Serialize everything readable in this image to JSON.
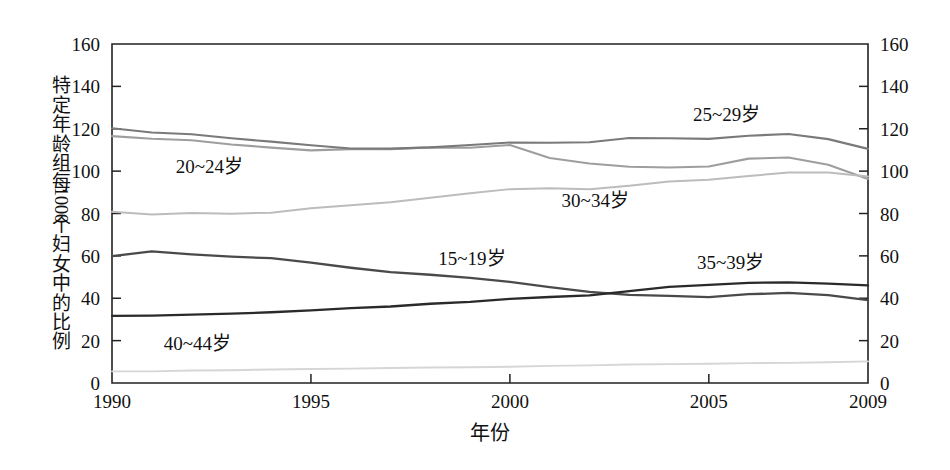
{
  "chart_data": {
    "type": "line",
    "title": "",
    "xlabel": "年份",
    "ylabel": "特定年龄组每1000个妇女中的比例",
    "ylabel_parts": [
      "特",
      "定",
      "年",
      "龄",
      "组",
      "每",
      "1000",
      "个",
      "妇",
      "女",
      "中",
      "的",
      "比",
      "例"
    ],
    "xlim": [
      1990,
      2009
    ],
    "ylim": [
      0,
      160
    ],
    "grid": false,
    "legend_position": "inline-annotations",
    "x_ticks": [
      1990,
      1995,
      2000,
      2005,
      2009
    ],
    "x_tick_labels": [
      "1990",
      "1995",
      "2000",
      "2005",
      "2009"
    ],
    "y_ticks": [
      0,
      20,
      40,
      60,
      80,
      100,
      120,
      140,
      160
    ],
    "y_tick_labels_left": [
      "0",
      "20",
      "40",
      "60",
      "80",
      "100",
      "120",
      "140",
      "160"
    ],
    "y_tick_labels_right": [
      "0",
      "20",
      "40",
      "60",
      "80",
      "100",
      "120",
      "140",
      "160"
    ],
    "x": [
      1990,
      1991,
      1992,
      1993,
      1994,
      1995,
      1996,
      1997,
      1998,
      1999,
      2000,
      2001,
      2002,
      2003,
      2004,
      2005,
      2006,
      2007,
      2008,
      2009
    ],
    "series": [
      {
        "name": "15~19岁",
        "label": "15~19岁",
        "color": "#4a4a4a",
        "width": 2.3,
        "label_x": 1998.2,
        "label_y": 55.5,
        "values": [
          59.9,
          62.1,
          60.7,
          59.6,
          58.9,
          56.8,
          54.4,
          52.3,
          51.1,
          49.6,
          47.7,
          45.3,
          43.0,
          41.6,
          41.1,
          40.5,
          41.9,
          42.5,
          41.5,
          39.1
        ]
      },
      {
        "name": "20~24岁",
        "label": "20~24岁",
        "color": "#9e9e9e",
        "width": 2.1,
        "label_x": 1991.6,
        "label_y": 99.0,
        "values": [
          116.5,
          115.3,
          114.6,
          112.6,
          111.1,
          109.8,
          110.4,
          110.4,
          111.2,
          111.0,
          112.3,
          106.2,
          103.6,
          102.1,
          101.7,
          102.2,
          105.9,
          106.4,
          103.0,
          96.3
        ]
      },
      {
        "name": "25~29岁",
        "label": "25~29岁",
        "color": "#7a7a7a",
        "width": 2.1,
        "label_x": 2004.6,
        "label_y": 123.5,
        "values": [
          120.2,
          118.2,
          117.4,
          115.5,
          113.9,
          112.2,
          110.7,
          110.6,
          111.2,
          112.3,
          113.5,
          113.4,
          113.6,
          115.6,
          115.5,
          115.2,
          116.7,
          117.5,
          115.1,
          110.5
        ]
      },
      {
        "name": "30~34岁",
        "label": "30~34岁",
        "color": "#bcbcbc",
        "width": 2.0,
        "label_x": 2001.3,
        "label_y": 83.2,
        "values": [
          80.8,
          79.5,
          80.2,
          79.9,
          80.4,
          82.5,
          83.9,
          85.3,
          87.4,
          89.6,
          91.5,
          91.9,
          91.5,
          93.1,
          95.1,
          95.9,
          97.7,
          99.3,
          99.3,
          97.5
        ]
      },
      {
        "name": "35~39岁",
        "label": "35~39岁",
        "color": "#2a2a2a",
        "width": 2.3,
        "label_x": 2004.7,
        "label_y": 54.0,
        "values": [
          31.7,
          31.8,
          32.3,
          32.7,
          33.4,
          34.3,
          35.3,
          36.1,
          37.4,
          38.3,
          39.7,
          40.6,
          41.4,
          43.4,
          45.4,
          46.3,
          47.3,
          47.5,
          46.9,
          46.1
        ]
      },
      {
        "name": "40~44岁",
        "label": "40~44岁",
        "color": "#d6d6d6",
        "width": 1.9,
        "label_x": 1991.3,
        "label_y": 15.5,
        "values": [
          5.5,
          5.5,
          5.9,
          6.0,
          6.4,
          6.6,
          6.8,
          7.1,
          7.3,
          7.4,
          7.7,
          8.1,
          8.3,
          8.7,
          8.9,
          9.1,
          9.4,
          9.5,
          9.8,
          10.2
        ]
      }
    ]
  },
  "plot": {
    "left": 112,
    "top": 44,
    "right": 868,
    "bottom": 383
  }
}
